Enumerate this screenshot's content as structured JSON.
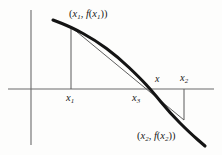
{
  "figure": {
    "axis_color": "#6b6b6b",
    "curve_color": "#141414",
    "secant_color": "#4d4d4d",
    "dropline_color": "#5a5a5a",
    "background": "#fdfdfc"
  },
  "labels": {
    "point1": "(x₁, f(x₁))",
    "point2": "(x₂, f(x₂))",
    "x1": "x₁",
    "x2": "x₂",
    "x3": "x₃",
    "x_root": "x"
  },
  "chart_data": {
    "type": "line",
    "title": "",
    "xlabel": "",
    "ylabel": "",
    "grid": false,
    "legend": "none",
    "axes": {
      "x_axis": {
        "y_pixel": 89,
        "x_start": 8,
        "x_end": 214
      },
      "y_axis": {
        "x_pixel": 31,
        "y_start": 10,
        "y_end": 145
      }
    },
    "annotations": [
      {
        "name": "point1-label",
        "text": "(x₁, f(x₁))",
        "x": 69,
        "y": 9
      },
      {
        "name": "point2-label",
        "text": "(x₂, f(x₂))",
        "x": 137,
        "y": 131
      },
      {
        "name": "x1-tick-label",
        "text": "x₁",
        "x": 66,
        "y": 93
      },
      {
        "name": "x3-tick-label",
        "text": "x₃",
        "x": 132,
        "y": 93
      },
      {
        "name": "x-root-label",
        "text": "x",
        "x": 155,
        "y": 74
      },
      {
        "name": "x2-tick-label",
        "text": "x₂",
        "x": 180,
        "y": 73
      }
    ],
    "series": [
      {
        "name": "function-curve",
        "role": "f(x)",
        "style": "thick-solid",
        "points": [
          [
            53,
            20
          ],
          [
            71,
            27
          ],
          [
            95,
            40
          ],
          [
            118,
            57
          ],
          [
            140,
            78
          ],
          [
            152,
            91
          ],
          [
            170,
            113
          ],
          [
            190,
            133
          ],
          [
            205,
            146
          ]
        ]
      },
      {
        "name": "secant-line",
        "role": "chord through (x1,f(x1)) and (x2,f(x2))",
        "style": "thin-solid",
        "points": [
          [
            71,
            27
          ],
          [
            184,
            120
          ]
        ]
      },
      {
        "name": "x1-dropline",
        "role": "vertical from (x1,f(x1)) to x-axis",
        "style": "thin-solid",
        "points": [
          [
            71,
            27
          ],
          [
            71,
            89
          ]
        ]
      },
      {
        "name": "x2-dropline",
        "role": "vertical from x-axis down to (x2,f(x2))",
        "style": "thin-solid",
        "points": [
          [
            184,
            89
          ],
          [
            184,
            120
          ]
        ]
      }
    ],
    "key_x_values": {
      "x1": 71,
      "x3": 139,
      "x_root": 152,
      "x2": 184
    }
  }
}
